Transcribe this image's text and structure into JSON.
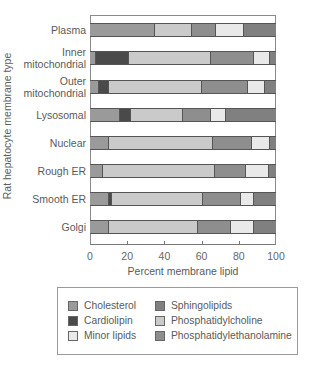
{
  "chart_data": {
    "type": "bar",
    "orientation": "horizontal",
    "stacked": true,
    "title": "",
    "xlabel": "Percent membrane lipid",
    "ylabel": "Rat hepatocyte membrane type",
    "xlim": [
      0,
      100
    ],
    "xticks": [
      0,
      20,
      40,
      60,
      80,
      100
    ],
    "grid": false,
    "legend_position": "bottom",
    "categories": [
      "Plasma",
      "Inner mitochondrial",
      "Outer mitochondrial",
      "Lysosomal",
      "Nuclear",
      "Rough ER",
      "Smooth ER",
      "Golgi"
    ],
    "category_label_lines": [
      [
        "Plasma"
      ],
      [
        "Inner",
        "mitochondrial"
      ],
      [
        "Outer",
        "mitochondrial"
      ],
      [
        "Lysosomal"
      ],
      [
        "Nuclear"
      ],
      [
        "Rough ER"
      ],
      [
        "Smooth ER"
      ],
      [
        "Golgi"
      ]
    ],
    "series": [
      {
        "name": "Cholesterol",
        "color": "#9a9a9a",
        "values": [
          35,
          3,
          5,
          16,
          10,
          7,
          10,
          10
        ]
      },
      {
        "name": "Cardiolipin",
        "color": "#4a4a4a",
        "values": [
          0,
          18,
          5,
          6,
          0,
          0,
          2,
          0
        ]
      },
      {
        "name": "Phosphatidylcholine",
        "color": "#cacaca",
        "values": [
          20,
          44,
          50,
          28,
          56,
          60,
          49,
          48
        ]
      },
      {
        "name": "Phosphatidylethanolamine",
        "color": "#8e8e8e",
        "values": [
          13,
          23,
          25,
          15,
          21,
          17,
          20,
          18
        ]
      },
      {
        "name": "Minor lipids",
        "color": "#e9e9e9",
        "values": [
          15,
          9,
          9,
          8,
          10,
          12,
          7,
          12
        ]
      },
      {
        "name": "Sphingolipids",
        "color": "#808080",
        "values": [
          17,
          3,
          6,
          27,
          3,
          4,
          12,
          12
        ]
      }
    ]
  },
  "legend": {
    "items": [
      {
        "label": "Cholesterol",
        "color": "#9a9a9a"
      },
      {
        "label": "Cardiolipin",
        "color": "#4a4a4a"
      },
      {
        "label": "Minor lipids",
        "color": "#e9e9e9"
      },
      {
        "label": "Sphingolipids",
        "color": "#808080"
      },
      {
        "label": "Phosphatidylcholine",
        "color": "#cacaca"
      },
      {
        "label": "Phosphatidylethanolamine",
        "color": "#8e8e8e"
      }
    ]
  }
}
